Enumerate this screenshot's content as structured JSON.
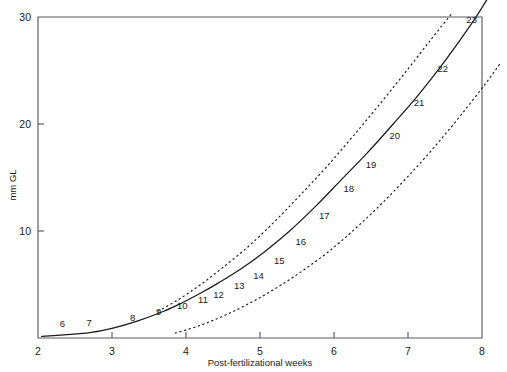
{
  "chart_data": {
    "type": "line",
    "title": "",
    "xlabel": "Post-fertilizational weeks",
    "ylabel": "mm GL",
    "xlim": [
      2,
      8
    ],
    "ylim": [
      0,
      30
    ],
    "xticks": [
      "2",
      "3",
      "4",
      "5",
      "6",
      "7",
      "8"
    ],
    "xtick_values": [
      2,
      3,
      4,
      5,
      6,
      7,
      8
    ],
    "yticks": [
      "10",
      "20",
      "30"
    ],
    "ytick_values": [
      10,
      20,
      30
    ],
    "grid": false,
    "legend": false,
    "series": [
      {
        "name": "mean greatest length",
        "style": "solid",
        "points": [
          {
            "x": 2.05,
            "y": 0.15
          },
          {
            "x": 2.35,
            "y": 0.3
          },
          {
            "x": 2.7,
            "y": 0.5
          },
          {
            "x": 3.0,
            "y": 0.9
          },
          {
            "x": 3.35,
            "y": 1.6
          },
          {
            "x": 3.7,
            "y": 2.5
          },
          {
            "x": 3.95,
            "y": 3.3
          },
          {
            "x": 4.2,
            "y": 4.2
          },
          {
            "x": 4.45,
            "y": 5.2
          },
          {
            "x": 4.75,
            "y": 6.5
          },
          {
            "x": 5.05,
            "y": 8.0
          },
          {
            "x": 5.4,
            "y": 10.0
          },
          {
            "x": 5.75,
            "y": 12.3
          },
          {
            "x": 6.1,
            "y": 14.8
          },
          {
            "x": 6.45,
            "y": 17.3
          },
          {
            "x": 6.8,
            "y": 20.0
          },
          {
            "x": 7.15,
            "y": 22.8
          },
          {
            "x": 7.5,
            "y": 25.9
          },
          {
            "x": 7.88,
            "y": 29.6
          },
          {
            "x": 8.1,
            "y": 32.0
          }
        ]
      },
      {
        "name": "upper confidence band",
        "style": "dashed",
        "points": [
          {
            "x": 3.62,
            "y": 2.5
          },
          {
            "x": 3.9,
            "y": 3.6
          },
          {
            "x": 4.2,
            "y": 5.0
          },
          {
            "x": 4.5,
            "y": 6.6
          },
          {
            "x": 4.85,
            "y": 8.6
          },
          {
            "x": 5.2,
            "y": 10.9
          },
          {
            "x": 5.55,
            "y": 13.4
          },
          {
            "x": 5.9,
            "y": 16.0
          },
          {
            "x": 6.25,
            "y": 18.8
          },
          {
            "x": 6.6,
            "y": 21.7
          },
          {
            "x": 6.95,
            "y": 24.7
          },
          {
            "x": 7.3,
            "y": 27.8
          },
          {
            "x": 7.6,
            "y": 30.4
          }
        ]
      },
      {
        "name": "lower confidence band",
        "style": "dashed",
        "points": [
          {
            "x": 3.85,
            "y": 0.45
          },
          {
            "x": 4.2,
            "y": 1.2
          },
          {
            "x": 4.55,
            "y": 2.2
          },
          {
            "x": 4.9,
            "y": 3.4
          },
          {
            "x": 5.25,
            "y": 4.8
          },
          {
            "x": 5.6,
            "y": 6.4
          },
          {
            "x": 5.95,
            "y": 8.2
          },
          {
            "x": 6.3,
            "y": 10.3
          },
          {
            "x": 6.65,
            "y": 12.6
          },
          {
            "x": 7.0,
            "y": 15.1
          },
          {
            "x": 7.35,
            "y": 17.8
          },
          {
            "x": 7.7,
            "y": 20.7
          },
          {
            "x": 8.05,
            "y": 23.8
          },
          {
            "x": 8.25,
            "y": 25.7
          }
        ]
      }
    ],
    "stage_labels": [
      {
        "label": "6",
        "x": 2.33,
        "y": 1.05
      },
      {
        "label": "7",
        "x": 2.69,
        "y": 1.15
      },
      {
        "label": "8",
        "x": 3.28,
        "y": 1.55
      },
      {
        "label": "9",
        "x": 3.63,
        "y": 2.15
      },
      {
        "label": "10",
        "x": 3.95,
        "y": 2.75
      },
      {
        "label": "11",
        "x": 4.23,
        "y": 3.25
      },
      {
        "label": "12",
        "x": 4.44,
        "y": 3.75
      },
      {
        "label": "13",
        "x": 4.72,
        "y": 4.55
      },
      {
        "label": "14",
        "x": 4.98,
        "y": 5.55
      },
      {
        "label": "15",
        "x": 5.26,
        "y": 6.95
      },
      {
        "label": "16",
        "x": 5.55,
        "y": 8.7
      },
      {
        "label": "17",
        "x": 5.87,
        "y": 11.1
      },
      {
        "label": "18",
        "x": 6.2,
        "y": 13.6
      },
      {
        "label": "19",
        "x": 6.5,
        "y": 15.9
      },
      {
        "label": "20",
        "x": 6.82,
        "y": 18.6
      },
      {
        "label": "21",
        "x": 7.15,
        "y": 21.7
      },
      {
        "label": "22",
        "x": 7.47,
        "y": 24.9
      },
      {
        "label": "23",
        "x": 7.86,
        "y": 29.4
      }
    ]
  }
}
